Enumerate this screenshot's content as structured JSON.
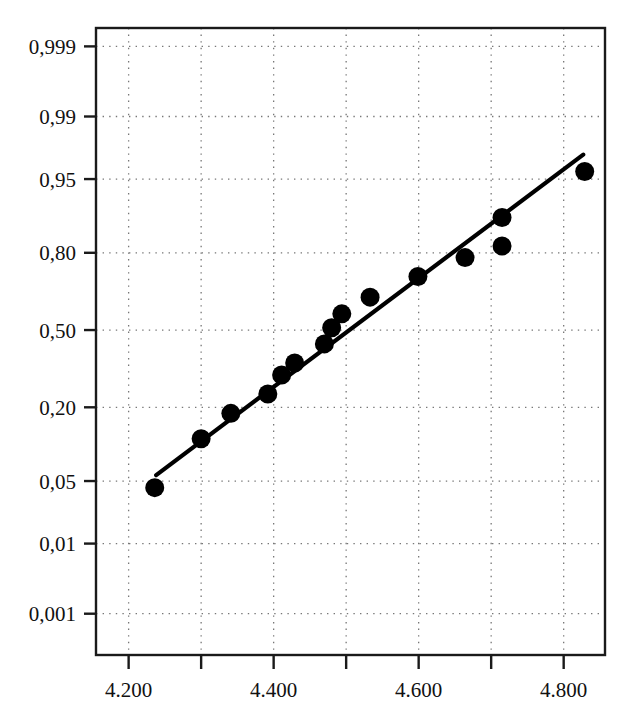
{
  "chart_data": {
    "type": "scatter",
    "title": "",
    "subtitle": "",
    "xlabel": "",
    "ylabel": "",
    "plot_kind": "normal-probability-plot",
    "grid": true,
    "legend": false,
    "legend_position": "none",
    "xlim": [
      4.155,
      4.857
    ],
    "ylim_probability": [
      0.0002,
      0.9995
    ],
    "x_tick_labels": [
      "4.200",
      "4.400",
      "4.600",
      "4.800"
    ],
    "x_tick_values": [
      4.2,
      4.4,
      4.6,
      4.8
    ],
    "x_gridline_values": [
      4.2,
      4.3,
      4.4,
      4.5,
      4.6,
      4.7,
      4.8
    ],
    "y_tick_labels": [
      "0,999",
      "0,99",
      "0,95",
      "0,80",
      "0,50",
      "0,20",
      "0,05",
      "0,01",
      "0,001"
    ],
    "y_tick_values": [
      0.999,
      0.99,
      0.95,
      0.8,
      0.5,
      0.2,
      0.05,
      0.01,
      0.001
    ],
    "series": [
      {
        "name": "data-points",
        "marker": "filled-circle",
        "color": "#000000",
        "points": [
          {
            "x": 4.236,
            "y": 0.043
          },
          {
            "x": 4.3,
            "y": 0.118
          },
          {
            "x": 4.341,
            "y": 0.182
          },
          {
            "x": 4.392,
            "y": 0.243
          },
          {
            "x": 4.411,
            "y": 0.312
          },
          {
            "x": 4.429,
            "y": 0.36
          },
          {
            "x": 4.47,
            "y": 0.44
          },
          {
            "x": 4.48,
            "y": 0.51
          },
          {
            "x": 4.494,
            "y": 0.57
          },
          {
            "x": 4.533,
            "y": 0.64
          },
          {
            "x": 4.599,
            "y": 0.72
          },
          {
            "x": 4.664,
            "y": 0.785
          },
          {
            "x": 4.715,
            "y": 0.82
          },
          {
            "x": 4.715,
            "y": 0.89
          },
          {
            "x": 4.829,
            "y": 0.958
          }
        ]
      }
    ],
    "fit_line": {
      "name": "fitted-line",
      "color": "#000000",
      "start": {
        "x": 4.238,
        "y": 0.057
      },
      "end": {
        "x": 4.827,
        "y": 0.972
      }
    },
    "annotations": []
  }
}
